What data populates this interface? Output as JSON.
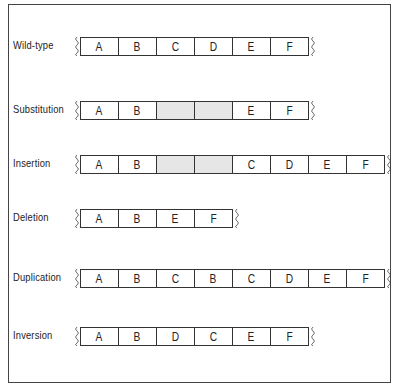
{
  "rows": [
    {
      "label": "Wild-type",
      "top": 36,
      "segments": [
        {
          "t": "A"
        },
        {
          "t": "B"
        },
        {
          "t": "C"
        },
        {
          "t": "D"
        },
        {
          "t": "E"
        },
        {
          "t": "F"
        }
      ]
    },
    {
      "label": "Substitution",
      "top": 100,
      "segments": [
        {
          "t": "A"
        },
        {
          "t": "B"
        },
        {
          "t": "",
          "shaded": true
        },
        {
          "t": "",
          "shaded": true
        },
        {
          "t": "E"
        },
        {
          "t": "F"
        }
      ]
    },
    {
      "label": "Insertion",
      "top": 154,
      "segments": [
        {
          "t": "A"
        },
        {
          "t": "B"
        },
        {
          "t": "",
          "shaded": true
        },
        {
          "t": "",
          "shaded": true
        },
        {
          "t": "C"
        },
        {
          "t": "D"
        },
        {
          "t": "E"
        },
        {
          "t": "F"
        }
      ]
    },
    {
      "label": "Deletion",
      "top": 208,
      "segments": [
        {
          "t": "A"
        },
        {
          "t": "B"
        },
        {
          "t": "E"
        },
        {
          "t": "F"
        }
      ]
    },
    {
      "label": "Duplication",
      "top": 268,
      "segments": [
        {
          "t": "A"
        },
        {
          "t": "B"
        },
        {
          "t": "C"
        },
        {
          "t": "B"
        },
        {
          "t": "C"
        },
        {
          "t": "D"
        },
        {
          "t": "E"
        },
        {
          "t": "F"
        }
      ]
    },
    {
      "label": "Inversion",
      "top": 326,
      "segments": [
        {
          "t": "A"
        },
        {
          "t": "B"
        },
        {
          "t": "D"
        },
        {
          "t": "C"
        },
        {
          "t": "E"
        },
        {
          "t": "F"
        }
      ]
    }
  ]
}
